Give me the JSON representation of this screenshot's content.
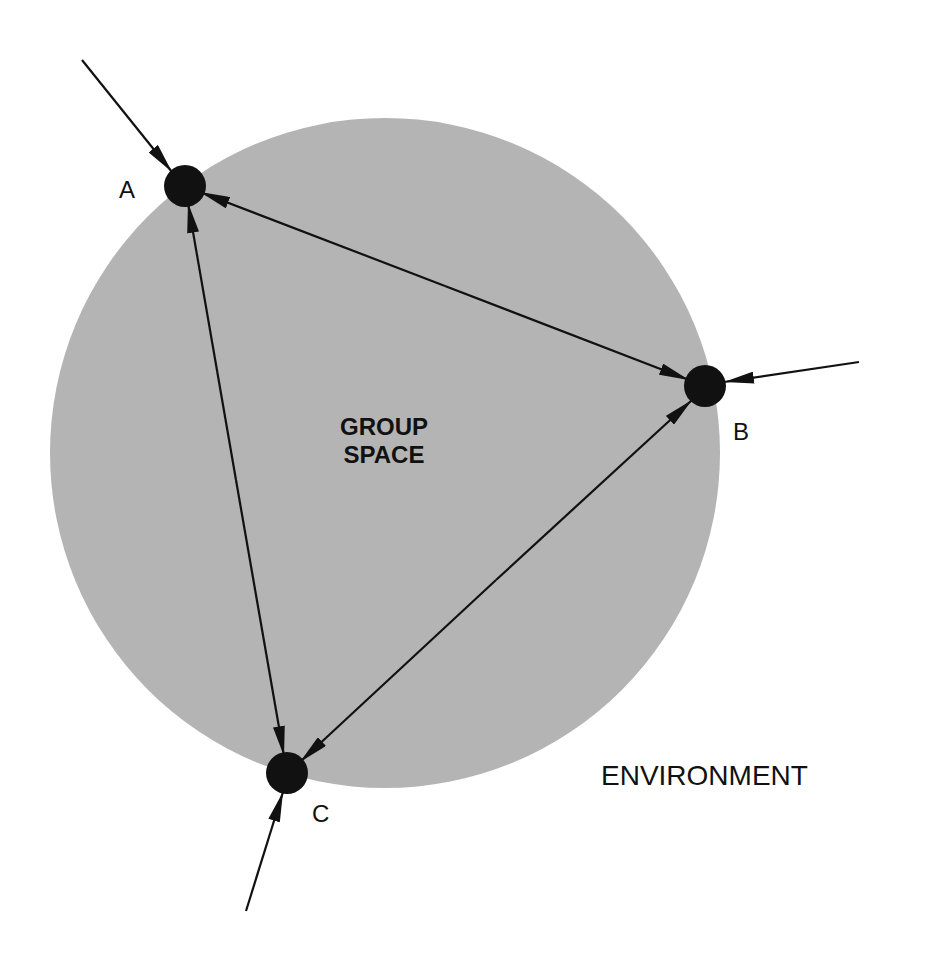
{
  "diagram": {
    "group_space_label_line1": "GROUP",
    "group_space_label_line2": "SPACE",
    "environment_label": "ENVIRONMENT",
    "nodes": [
      {
        "id": "A",
        "label": "A"
      },
      {
        "id": "B",
        "label": "B"
      },
      {
        "id": "C",
        "label": "C"
      }
    ],
    "edges": [
      {
        "from": "A",
        "to": "B",
        "direction": "bidirectional"
      },
      {
        "from": "A",
        "to": "C",
        "direction": "bidirectional"
      },
      {
        "from": "B",
        "to": "C",
        "direction": "bidirectional"
      },
      {
        "from": "environment",
        "to": "A",
        "direction": "inward"
      },
      {
        "from": "environment",
        "to": "B",
        "direction": "inward"
      },
      {
        "from": "environment",
        "to": "C",
        "direction": "inward"
      }
    ],
    "colors": {
      "group_space_fill": "#b4b4b4",
      "node_fill": "#111111",
      "line": "#111111",
      "background": "#ffffff"
    }
  }
}
